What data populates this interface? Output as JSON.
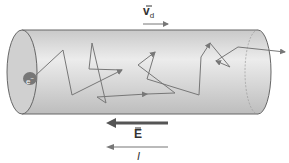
{
  "diagram": {
    "labels": {
      "drift_velocity": "v",
      "drift_velocity_sub": "d",
      "electric_field": "E",
      "current": "I",
      "electron": "e"
    },
    "arrows": {
      "drift_velocity": {
        "direction": "right"
      },
      "electric_field": {
        "direction": "left"
      },
      "current": {
        "direction": "left"
      }
    },
    "colors": {
      "conductor_fill": "#d4d4d4",
      "outline": "#666666",
      "path": "#777777",
      "field_arrow": "#555555"
    }
  }
}
